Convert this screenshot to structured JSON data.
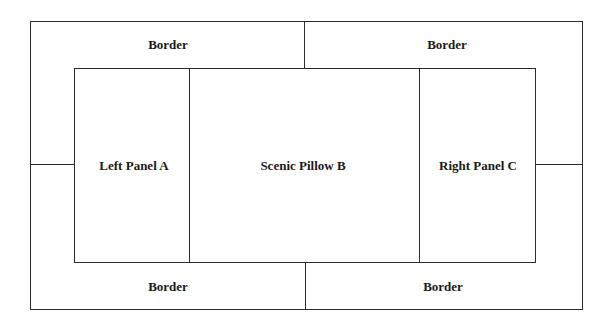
{
  "diagram": {
    "type": "layout-schematic",
    "border_regions": [
      {
        "id": "top-left",
        "label": "Border"
      },
      {
        "id": "top-right",
        "label": "Border"
      },
      {
        "id": "bottom-left",
        "label": "Border"
      },
      {
        "id": "bottom-right",
        "label": "Border"
      }
    ],
    "panels": [
      {
        "id": "left",
        "label": "Left Panel A"
      },
      {
        "id": "center",
        "label": "Scenic Pillow B"
      },
      {
        "id": "right",
        "label": "Right Panel C"
      }
    ],
    "colors": {
      "line": "#2b2b2b",
      "text": "#1a1a1a",
      "background": "#ffffff"
    }
  }
}
